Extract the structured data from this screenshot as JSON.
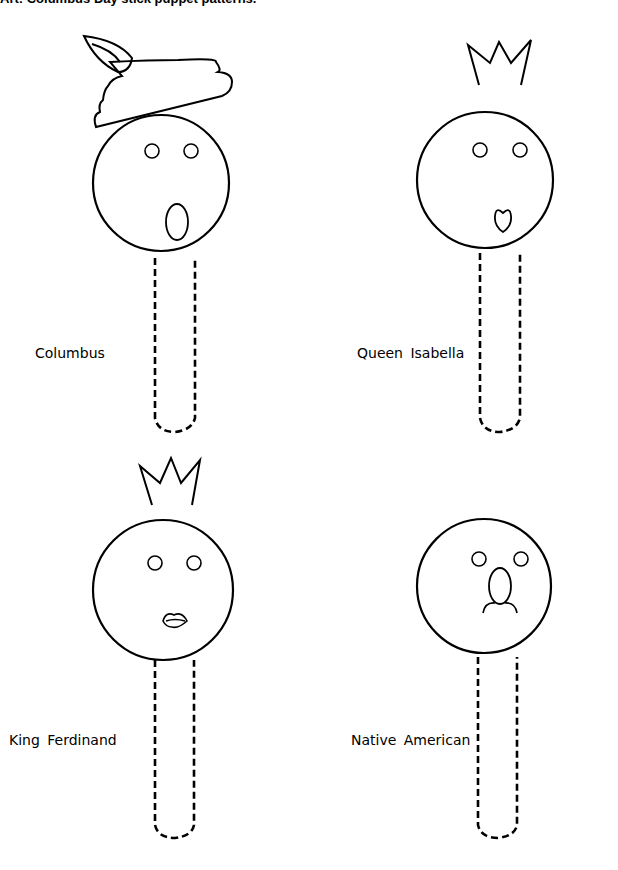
{
  "title": "Art: Columbus Day stick puppet patterns.",
  "puppets": [
    {
      "label": "Columbus",
      "hat": "feathered-cap",
      "mouth": "oval"
    },
    {
      "label": "Queen Isabella",
      "hat": "crown",
      "mouth": "heart"
    },
    {
      "label": "King Ferdinand",
      "hat": "crown",
      "mouth": "lips"
    },
    {
      "label": "Native American",
      "hat": "none",
      "mouth": "nose-and-frown"
    }
  ],
  "colors": {
    "line": "#000000",
    "background": "#ffffff"
  }
}
